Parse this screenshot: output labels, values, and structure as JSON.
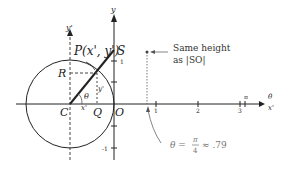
{
  "diagram": {
    "points": {
      "P": "P(x', y')",
      "S": "S",
      "R": "R",
      "C": "C",
      "Q": "Q",
      "O": "O"
    },
    "axes": {
      "y_prime": "y'",
      "y": "y",
      "x_prime": "x'",
      "theta_axis": "θ",
      "y_prime_small": "y'",
      "x_prime_small": "x'"
    },
    "angle_label": "θ",
    "y_ticks": [
      "1",
      "-1"
    ],
    "theta_ticks": [
      "1",
      "2",
      "3",
      "π"
    ],
    "annotation_top": {
      "line1": "Same height",
      "line2": "as |SO|"
    },
    "annotation_bottom": {
      "theta": "θ =",
      "num": "π",
      "den": "4",
      "value": "≈ .79"
    },
    "colors": {
      "ink": "#222222",
      "gray": "#777777"
    }
  }
}
